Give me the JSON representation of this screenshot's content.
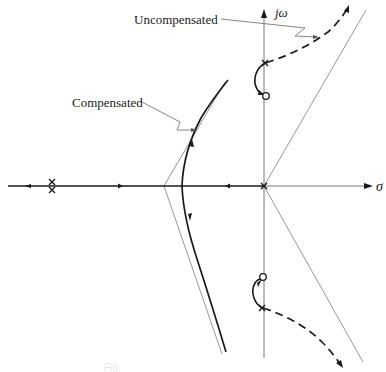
{
  "diagram": {
    "type": "root-locus",
    "labels": {
      "imag_axis": "jω",
      "real_axis": "σ",
      "uncompensated": "Uncompensated",
      "compensated": "Compensated"
    },
    "caption": "Fig.",
    "colors": {
      "ink": "#1a1a1a",
      "asymptote": "#8a8a8a",
      "axis": "#555555",
      "background": "#ffffff"
    },
    "markers": {
      "poles": [
        {
          "name": "double-pole-left",
          "type": "double-x"
        },
        {
          "name": "pole-origin",
          "type": "x"
        },
        {
          "name": "pole-upper-complex",
          "type": "x"
        },
        {
          "name": "pole-lower-complex",
          "type": "x"
        }
      ],
      "zeros": [
        {
          "name": "zero-upper-complex",
          "type": "o"
        },
        {
          "name": "zero-lower-complex",
          "type": "o"
        }
      ]
    },
    "branches": [
      {
        "name": "uncompensated-branch-upper",
        "style": "dashed"
      },
      {
        "name": "uncompensated-branch-lower",
        "style": "dashed"
      },
      {
        "name": "compensated-branch-upper",
        "style": "solid"
      },
      {
        "name": "compensated-branch-lower",
        "style": "solid"
      },
      {
        "name": "real-axis-locus",
        "style": "solid"
      }
    ]
  }
}
